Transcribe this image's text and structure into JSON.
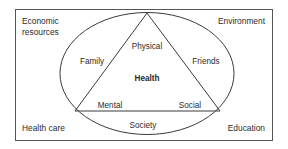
{
  "diagram": {
    "colors": {
      "background": "#ffffff",
      "frame_stroke": "#555555",
      "shape_stroke": "#3a3a3a",
      "text": "#2b2b2b"
    },
    "corner_labels": {
      "top_left_line1": "Economic",
      "top_left_line2": "resources",
      "top_right": "Environment",
      "bottom_left": "Health care",
      "bottom_right": "Education"
    },
    "triangle_labels": {
      "apex": "Physical",
      "bottom_left": "Mental",
      "bottom_right": "Social",
      "center": "Health"
    },
    "ellipse_labels": {
      "left": "Family",
      "right": "Friends",
      "bottom": "Society"
    }
  }
}
